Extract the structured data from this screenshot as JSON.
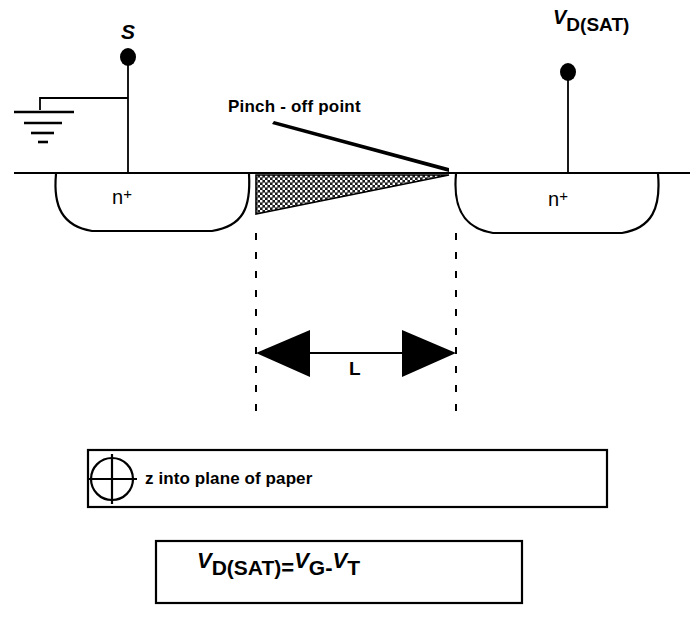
{
  "diagram": {
    "colors": {
      "ink": "#000000",
      "background": "#ffffff",
      "depletion_fill": "#2b2b2b"
    },
    "terminals": {
      "source": {
        "label": "S",
        "name": "source-terminal"
      },
      "drain": {
        "label_main": "V",
        "label_sub": "D(SAT)",
        "name": "drain-terminal"
      }
    },
    "regions": {
      "left_well_label": "n",
      "left_well_sup": "+",
      "right_well_label": "n",
      "right_well_sup": "+"
    },
    "annotations": {
      "pinch_off": "Pinch - off  point",
      "channel_length": "L"
    },
    "legend": {
      "icon": "z-into-page-icon",
      "text": "z into plane of paper"
    },
    "equation": {
      "lhs_main": "V",
      "lhs_sub": "D(SAT)",
      "equals": "=",
      "rhs1_main": "V",
      "rhs1_sub": "G",
      "minus": "-",
      "rhs2_main": "V",
      "rhs2_sub": "T",
      "plain": "V D(SAT) = V G - V T"
    }
  }
}
